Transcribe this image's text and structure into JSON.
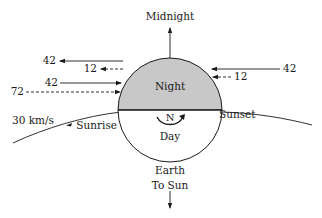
{
  "diagram": {
    "body_label": "Earth",
    "top_label": "Midnight",
    "bottom_label": "To Sun",
    "night_label": "Night",
    "day_label": "Day",
    "pole_label": "N",
    "sunrise_label": "Sunrise",
    "sunset_label": "Sunset",
    "orbital_speed_label": "30 km/s",
    "colors": {
      "night_fill": "#c8c8c8",
      "day_fill": "#ffffff",
      "stroke": "#1a1a1a"
    },
    "left_arrows": [
      {
        "value": "42",
        "direction": "left",
        "style": "solid"
      },
      {
        "value": "12",
        "direction": "left",
        "style": "dashed"
      },
      {
        "value": "42",
        "direction": "right",
        "style": "solid"
      },
      {
        "value": "72",
        "direction": "right",
        "style": "dashed"
      }
    ],
    "right_arrows": [
      {
        "value": "42",
        "direction": "left",
        "style": "solid"
      },
      {
        "value": "12",
        "direction": "left",
        "style": "dashed"
      }
    ]
  }
}
